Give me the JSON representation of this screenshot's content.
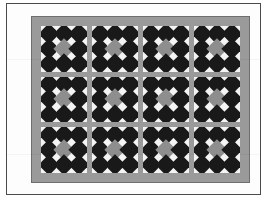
{
  "image": {
    "subject": "patchwork quilt",
    "title": "Quilt with four-by-three grid of diamond-in-square blocks",
    "background_color": "#ffffff",
    "frame_color": "#4a4a4a"
  },
  "quilt": {
    "border_color": "#9a9a9a",
    "border_outline_color": "#6e6e6e",
    "sashing_color": "#9a9a9a",
    "block_background_color": "#f4f4f4",
    "dark_fabric_color": "#191919",
    "center_fabric_color": "#8e8e8e",
    "columns": 4,
    "rows": 3,
    "block_count": 12,
    "block_name": "diamond-in-square nine patch",
    "blocks": [
      {
        "row": 1,
        "col": 1,
        "center": "grey",
        "corners": "dark"
      },
      {
        "row": 1,
        "col": 2,
        "center": "grey",
        "corners": "dark"
      },
      {
        "row": 1,
        "col": 3,
        "center": "grey",
        "corners": "dark"
      },
      {
        "row": 1,
        "col": 4,
        "center": "grey",
        "corners": "dark"
      },
      {
        "row": 2,
        "col": 1,
        "center": "grey",
        "corners": "dark"
      },
      {
        "row": 2,
        "col": 2,
        "center": "grey",
        "corners": "dark"
      },
      {
        "row": 2,
        "col": 3,
        "center": "grey",
        "corners": "dark"
      },
      {
        "row": 2,
        "col": 4,
        "center": "grey",
        "corners": "dark"
      },
      {
        "row": 3,
        "col": 1,
        "center": "grey",
        "corners": "dark"
      },
      {
        "row": 3,
        "col": 2,
        "center": "grey",
        "corners": "dark"
      },
      {
        "row": 3,
        "col": 3,
        "center": "grey",
        "corners": "dark"
      },
      {
        "row": 3,
        "col": 4,
        "center": "grey",
        "corners": "dark"
      }
    ],
    "cell_layout": [
      [
        "dark",
        "dark",
        "dark"
      ],
      [
        "dark",
        "grey",
        "dark"
      ],
      [
        "dark",
        "dark",
        "dark"
      ]
    ]
  }
}
